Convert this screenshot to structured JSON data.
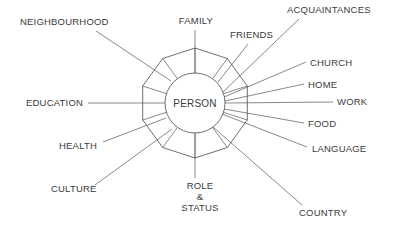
{
  "diagram": {
    "center": {
      "label": "PERSON",
      "cx": 195,
      "cy": 103,
      "r": 30
    },
    "ring": {
      "vertices": 10,
      "radius": 55
    },
    "colors": {
      "stroke": "#4a4a4a",
      "text": "#3a3a3a",
      "background": "#ffffff"
    },
    "nodes": [
      {
        "name": "family",
        "label": "FAMILY",
        "label_x": 196,
        "label_y": 24,
        "anchor": "middle",
        "spoke": {
          "x1": 195,
          "y1": 73,
          "x2": 195,
          "y2": 30
        }
      },
      {
        "name": "friends",
        "label": "FRIENDS",
        "label_x": 230,
        "label_y": 38,
        "anchor": "start",
        "spoke": {
          "x1": 218,
          "y1": 82,
          "x2": 248,
          "y2": 44
        }
      },
      {
        "name": "acquaintances",
        "label": "ACQUAINTANCES",
        "label_x": 287,
        "label_y": 13,
        "anchor": "start",
        "spoke": {
          "x1": 223,
          "y1": 92,
          "x2": 299,
          "y2": 19
        }
      },
      {
        "name": "church",
        "label": "CHURCH",
        "label_x": 310,
        "label_y": 66,
        "anchor": "start",
        "spoke": {
          "x1": 224,
          "y1": 97,
          "x2": 306,
          "y2": 62
        }
      },
      {
        "name": "home",
        "label": "HOME",
        "label_x": 308,
        "label_y": 88,
        "anchor": "start",
        "spoke": {
          "x1": 225,
          "y1": 101,
          "x2": 304,
          "y2": 84
        }
      },
      {
        "name": "work",
        "label": "WORK",
        "label_x": 337,
        "label_y": 105,
        "anchor": "start",
        "spoke": {
          "x1": 225,
          "y1": 103,
          "x2": 333,
          "y2": 102
        }
      },
      {
        "name": "food",
        "label": "FOOD",
        "label_x": 308,
        "label_y": 127,
        "anchor": "start",
        "spoke": {
          "x1": 224,
          "y1": 109,
          "x2": 304,
          "y2": 123
        }
      },
      {
        "name": "language",
        "label": "LANGUAGE",
        "label_x": 312,
        "label_y": 152,
        "anchor": "start",
        "spoke": {
          "x1": 222,
          "y1": 114,
          "x2": 307,
          "y2": 147
        }
      },
      {
        "name": "country",
        "label": "COUNTRY",
        "label_x": 299,
        "label_y": 216,
        "anchor": "start",
        "spoke": {
          "x1": 213,
          "y1": 127,
          "x2": 302,
          "y2": 205
        }
      },
      {
        "name": "role-status",
        "label": "ROLE",
        "label_x": 200,
        "label_y": 189,
        "anchor": "middle",
        "label_line2": "&",
        "label_line3": "STATUS",
        "spoke": {
          "x1": 195,
          "y1": 133,
          "x2": 195,
          "y2": 178
        }
      },
      {
        "name": "culture",
        "label": "CULTURE",
        "label_x": 51,
        "label_y": 192,
        "anchor": "start",
        "spoke": {
          "x1": 172,
          "y1": 129,
          "x2": 95,
          "y2": 185
        }
      },
      {
        "name": "health",
        "label": "HEALTH",
        "label_x": 59,
        "label_y": 149,
        "anchor": "start",
        "spoke": {
          "x1": 166,
          "y1": 118,
          "x2": 103,
          "y2": 142
        }
      },
      {
        "name": "education",
        "label": "EDUCATION",
        "label_x": 26,
        "label_y": 106,
        "anchor": "start",
        "spoke": {
          "x1": 165,
          "y1": 103,
          "x2": 88,
          "y2": 103
        }
      },
      {
        "name": "neighbourhood",
        "label": "NEIGHBOURHOOD",
        "label_x": 20,
        "label_y": 25,
        "anchor": "start",
        "spoke": {
          "x1": 171,
          "y1": 81,
          "x2": 96,
          "y2": 31
        }
      }
    ]
  }
}
